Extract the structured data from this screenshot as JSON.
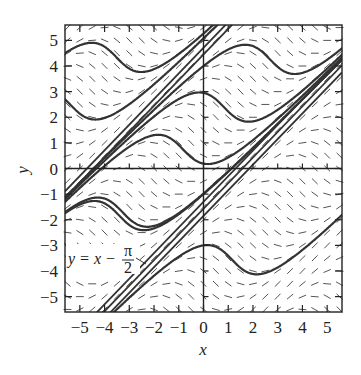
{
  "chart_data": {
    "type": "line",
    "title": "",
    "subtitle": "Direction field with solution curves",
    "equation": "dy/dx = sin(x - y)",
    "xlabel": "x",
    "ylabel": "y",
    "xlim": [
      -5.6,
      5.6
    ],
    "ylim": [
      -5.6,
      5.6
    ],
    "grid": false,
    "legend": "none",
    "x_ticks": [
      -5,
      -4,
      -3,
      -2,
      -1,
      0,
      1,
      2,
      3,
      4,
      5
    ],
    "x_tick_labels": [
      "−5",
      "−4",
      "−3",
      "−2",
      "−1",
      "0",
      "1",
      "2",
      "3",
      "4",
      "5"
    ],
    "y_ticks": [
      5,
      4,
      3,
      2,
      1,
      0,
      -1,
      -2,
      -3,
      -4,
      -5
    ],
    "y_tick_labels": [
      "5",
      "4",
      "3",
      "2",
      "1",
      "0",
      "−1",
      "−2",
      "−3",
      "−4",
      "−5"
    ],
    "direction_field": {
      "x_step": 0.5,
      "y_step": 0.5,
      "segment_length": 0.32
    },
    "line_solutions": [
      {
        "name": "y = x − π/2 + 2π",
        "intercept": 4.712
      },
      {
        "name": "y = x − π/2 + 2π (neighbor)",
        "intercept": 4.45
      },
      {
        "name": "y = x − π/2",
        "intercept": -1.571
      },
      {
        "name": "y = x − π/2 (neighbor a)",
        "intercept": -1.3
      },
      {
        "name": "y = x − π/2 (neighbor b)",
        "intercept": -1.85
      }
    ],
    "solution_curves": [
      {
        "x0": -5.6,
        "y0": 4.5
      },
      {
        "x0": -5.6,
        "y0": 2.7
      },
      {
        "x0": -5.6,
        "y0": -1.7
      },
      {
        "x0": -3.0,
        "y0": 0.85
      },
      {
        "x0": 0.0,
        "y0": 4.0
      },
      {
        "x0": 0.0,
        "y0": 2.95
      },
      {
        "x0": 0.0,
        "y0": -1.0
      },
      {
        "x0": 0.0,
        "y0": -3.0
      }
    ],
    "annotations": [
      {
        "text_lhs": "y = x −",
        "frac_num": "π",
        "frac_den": "2",
        "points_to": "line y = x − π/2",
        "at": [
          -5.4,
          -3.3
        ]
      }
    ]
  }
}
